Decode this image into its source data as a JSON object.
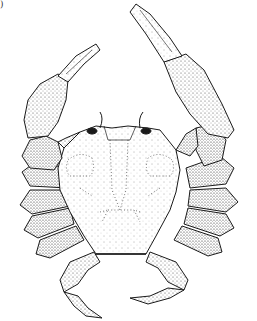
{
  "figure": {
    "style": "stippled line drawing",
    "corner_label": ")",
    "colors": {
      "ink": "#1a1a1a",
      "paper": "#ffffff"
    }
  }
}
